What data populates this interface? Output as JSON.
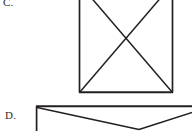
{
  "page": {
    "background_color": "#ffffff",
    "width": 192,
    "height": 131,
    "stroke_color": "#231f20",
    "text_color": "#2b2b2b"
  },
  "figures": [
    {
      "id": "figure-c",
      "label": "C.",
      "shape_name": "square-with-diagonals",
      "description": "Square with both diagonals drawn, forming an X; top edge cropped off the top of the image",
      "cropped": "top",
      "geometry": {
        "left": 79.5,
        "right": 172.5,
        "bottom": 92.5,
        "top": -14,
        "diagonal_intersection_x": 126,
        "diagonal_intersection_y": 39,
        "stroke_width": 1.6
      }
    },
    {
      "id": "figure-d",
      "label": "D.",
      "shape_name": "rectangle-with-v-line",
      "description": "Rectangle with a V shaped line from the top-left corner down to a low vertex and back up to the right; bottom and right edges cropped off the image",
      "cropped": "bottom-right",
      "geometry": {
        "left": 36.5,
        "top": 106.5,
        "right": 205,
        "bottom": 150,
        "v_vertex_x": 139,
        "v_vertex_y": 129,
        "stroke_width": 1.6
      }
    }
  ]
}
